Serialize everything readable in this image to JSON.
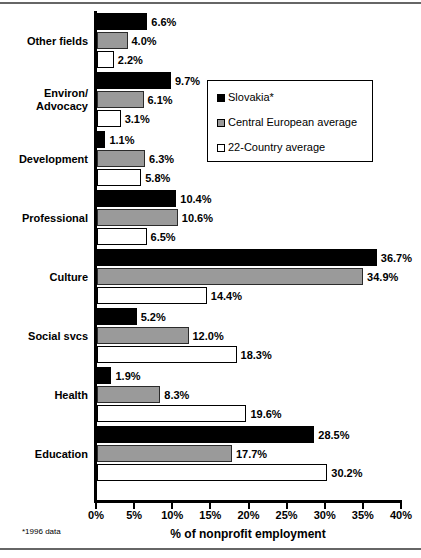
{
  "chart_data": {
    "type": "bar",
    "orientation": "horizontal",
    "title": "",
    "xlabel": "% of nonprofit employment",
    "ylabel": "",
    "xlim": [
      0,
      40
    ],
    "xticks": [
      0,
      5,
      10,
      15,
      20,
      25,
      30,
      35,
      40
    ],
    "xtick_labels": [
      "0%",
      "5%",
      "10%",
      "15%",
      "20%",
      "25%",
      "30%",
      "35%",
      "40%"
    ],
    "grid": false,
    "legend_position": "upper right",
    "categories": [
      "Other fields",
      "Environ/\nAdvocacy",
      "Development",
      "Professional",
      "Culture",
      "Social svcs",
      "Health",
      "Education"
    ],
    "series": [
      {
        "name": "Slovakia*",
        "color": "#000000",
        "values": [
          6.6,
          9.7,
          1.1,
          10.4,
          36.7,
          5.2,
          1.9,
          28.5
        ],
        "value_labels": [
          "6.6%",
          "9.7%",
          "1.1%",
          "10.4%",
          "36.7%",
          "5.2%",
          "1.9%",
          "28.5%"
        ]
      },
      {
        "name": "Central European average",
        "color": "#9a9a9a",
        "values": [
          4.0,
          6.1,
          6.3,
          10.6,
          34.9,
          12.0,
          8.3,
          17.7
        ],
        "value_labels": [
          "4.0%",
          "6.1%",
          "6.3%",
          "10.6%",
          "34.9%",
          "12.0%",
          "8.3%",
          "17.7%"
        ]
      },
      {
        "name": "22-Country average",
        "color": "#ffffff",
        "values": [
          2.2,
          3.1,
          5.8,
          6.5,
          14.4,
          18.3,
          19.6,
          30.2
        ],
        "value_labels": [
          "2.2%",
          "3.1%",
          "5.8%",
          "6.5%",
          "14.4%",
          "18.3%",
          "19.6%",
          "30.2%"
        ]
      }
    ],
    "footnote": "*1996 data"
  }
}
